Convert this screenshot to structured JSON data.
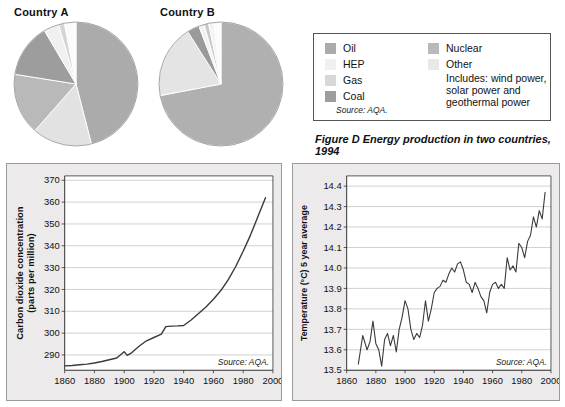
{
  "pies": {
    "country_a": {
      "title": "Country A",
      "slices": [
        {
          "name": "Oil",
          "value": 46.0,
          "color": "#ababab"
        },
        {
          "name": "Gas",
          "value": 15.5,
          "color": "#e2e2e2"
        },
        {
          "name": "Coal",
          "value": 16.0,
          "color": "#b9b9b9"
        },
        {
          "name": "Nuclear",
          "value": 14.0,
          "color": "#9d9d9d"
        },
        {
          "name": "HEP",
          "value": 4.0,
          "color": "#f0f0f0"
        },
        {
          "name": "Other",
          "value": 1.5,
          "color": "#d4d4d4"
        },
        {
          "name": "Other2",
          "value": 3.0,
          "color": "#fbfbfb"
        }
      ]
    },
    "country_b": {
      "title": "Country B",
      "slices": [
        {
          "name": "Oil",
          "value": 72.0,
          "color": "#b0b0b0"
        },
        {
          "name": "Gas",
          "value": 19.0,
          "color": "#e4e4e4"
        },
        {
          "name": "Coal",
          "value": 3.2,
          "color": "#9a9a9a"
        },
        {
          "name": "HEP",
          "value": 1.4,
          "color": "#f2f2f2"
        },
        {
          "name": "Nuclear",
          "value": 1.2,
          "color": "#c9c9c9"
        },
        {
          "name": "Other",
          "value": 1.4,
          "color": "#f4f4f4"
        },
        {
          "name": "Other2",
          "value": 1.8,
          "color": "#fbfbfb"
        }
      ]
    }
  },
  "legend": {
    "left_items": [
      {
        "label": "Oil",
        "color": "#ababab"
      },
      {
        "label": "HEP",
        "color": "#f0f0f0"
      },
      {
        "label": "Gas",
        "color": "#d8d8d8"
      },
      {
        "label": "Coal",
        "color": "#9d9d9d"
      }
    ],
    "right_items": [
      {
        "label": "Nuclear",
        "color": "#b9b9b9"
      },
      {
        "label": "Other",
        "color": "#e8e8e8"
      }
    ],
    "note_line1": "Includes: wind power,",
    "note_line2": "solar power and",
    "note_line3": "geothermal power",
    "source": "Source: AQA."
  },
  "caption": "Figure D Energy production in two countries, 1994",
  "chart_data": [
    {
      "type": "line",
      "title": "",
      "xlabel": "",
      "ylabel": "Carbon dioxide concentration (parts per million)",
      "ylabel_line1": "Carbon dioxide concentration",
      "ylabel_line2": "(parts per million)",
      "source": "Source: AQA.",
      "xlim": [
        1860,
        2000
      ],
      "ylim": [
        283,
        372
      ],
      "xticks": [
        1860,
        1880,
        1900,
        1920,
        1940,
        1960,
        1980,
        2000
      ],
      "yticks": [
        290,
        300,
        310,
        320,
        330,
        340,
        350,
        360,
        370
      ],
      "grid": true,
      "x": [
        1860,
        1865,
        1870,
        1875,
        1880,
        1885,
        1890,
        1895,
        1900,
        1902,
        1905,
        1910,
        1915,
        1920,
        1925,
        1928,
        1932,
        1936,
        1940,
        1945,
        1950,
        1955,
        1960,
        1965,
        1970,
        1975,
        1980,
        1985,
        1990,
        1995
      ],
      "values": [
        285.0,
        285.2,
        285.5,
        285.8,
        286.3,
        287.0,
        287.8,
        288.6,
        291.5,
        289.8,
        291.0,
        294.0,
        296.5,
        298.0,
        299.5,
        303.0,
        303.2,
        303.3,
        303.5,
        306.0,
        309.0,
        312.0,
        315.5,
        319.5,
        324.5,
        330.5,
        337.5,
        345.0,
        353.5,
        362.0
      ]
    },
    {
      "type": "line",
      "title": "",
      "xlabel": "",
      "ylabel": "Temperature (°C) 5 year average",
      "source": "Source: AQA.",
      "xlim": [
        1860,
        2000
      ],
      "ylim": [
        13.5,
        14.45
      ],
      "xticks": [
        1860,
        1880,
        1900,
        1920,
        1940,
        1960,
        1980,
        2000
      ],
      "yticks": [
        13.5,
        13.6,
        13.7,
        13.8,
        13.9,
        14.0,
        14.1,
        14.2,
        14.3,
        14.4
      ],
      "grid": true,
      "x": [
        1868,
        1871,
        1874,
        1876,
        1878,
        1880,
        1882,
        1884,
        1886,
        1888,
        1890,
        1892,
        1894,
        1896,
        1898,
        1900,
        1902,
        1904,
        1906,
        1908,
        1910,
        1912,
        1914,
        1916,
        1918,
        1920,
        1922,
        1924,
        1926,
        1928,
        1930,
        1932,
        1934,
        1936,
        1938,
        1940,
        1942,
        1944,
        1946,
        1948,
        1950,
        1952,
        1954,
        1956,
        1958,
        1960,
        1962,
        1964,
        1966,
        1968,
        1970,
        1972,
        1974,
        1976,
        1978,
        1980,
        1982,
        1984,
        1986,
        1988,
        1990,
        1992,
        1994,
        1996
      ],
      "values": [
        13.53,
        13.67,
        13.6,
        13.64,
        13.74,
        13.63,
        13.6,
        13.52,
        13.65,
        13.68,
        13.62,
        13.67,
        13.59,
        13.7,
        13.76,
        13.84,
        13.8,
        13.7,
        13.65,
        13.68,
        13.66,
        13.72,
        13.84,
        13.74,
        13.8,
        13.88,
        13.9,
        13.91,
        13.94,
        13.93,
        13.97,
        14.0,
        13.98,
        14.02,
        14.03,
        13.99,
        13.93,
        13.92,
        13.88,
        13.93,
        13.9,
        13.86,
        13.84,
        13.78,
        13.88,
        13.92,
        13.93,
        13.9,
        13.92,
        13.9,
        14.05,
        13.99,
        14.01,
        13.98,
        14.12,
        14.1,
        14.05,
        14.13,
        14.16,
        14.25,
        14.2,
        14.28,
        14.24,
        14.37
      ]
    }
  ]
}
